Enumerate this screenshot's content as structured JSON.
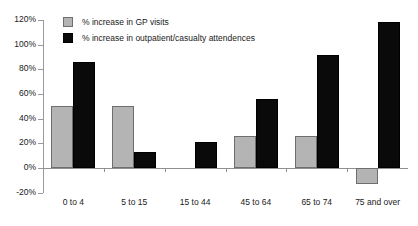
{
  "chart_data": {
    "type": "bar",
    "title": "",
    "subtitle": "",
    "xlabel": "",
    "ylabel": "",
    "ylim": [
      -20,
      120
    ],
    "ytick_labels": [
      "120%",
      "100%",
      "80%",
      "60%",
      "40%",
      "20%",
      "0%",
      "-20%"
    ],
    "ytick_values": [
      120,
      100,
      80,
      60,
      40,
      20,
      0,
      -20
    ],
    "grid": false,
    "legend_position": "top-left",
    "categories": [
      "0 to 4",
      "5 to 15",
      "15 to 44",
      "45 to 64",
      "65 to 74",
      "75 and over"
    ],
    "series": [
      {
        "name": "% increase in GP visits",
        "color": "#b4b4b4",
        "values": [
          50,
          50,
          0,
          26,
          26,
          -13
        ]
      },
      {
        "name": "% increase in outpatient/casualty attendences",
        "color": "#0a0a0a",
        "values": [
          86,
          13,
          21,
          56,
          92,
          118
        ]
      }
    ]
  },
  "legend": {
    "items": [
      {
        "label": "% increase in GP visits",
        "swatch": "grey-swatch-icon"
      },
      {
        "label": "% increase in outpatient/casualty attendences",
        "swatch": "black-swatch-icon"
      }
    ]
  }
}
